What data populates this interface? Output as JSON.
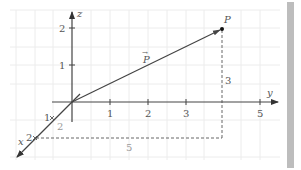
{
  "diagram": {
    "title": "",
    "colors": {
      "axis": "#444444",
      "grid": "#ececec",
      "vector": "#555555",
      "dashed": "#666666",
      "label": "#555555",
      "light_label": "#9a9a9a",
      "scrollbar": "#bdbdbd"
    },
    "axes": {
      "z": {
        "label": "z",
        "ticks": [
          "1",
          "2"
        ]
      },
      "y": {
        "label": "y",
        "ticks": [
          "1",
          "2",
          "3",
          "5"
        ]
      },
      "x": {
        "label": "x",
        "ticks": [
          "1",
          "2"
        ]
      }
    },
    "point": {
      "label": "P",
      "coords": [
        2,
        4,
        2
      ]
    },
    "vector": {
      "label": "P",
      "arrow_notation": "→"
    },
    "dashed_labels": {
      "vertical": "3",
      "horizontal": "5",
      "x_offset": "2"
    }
  }
}
